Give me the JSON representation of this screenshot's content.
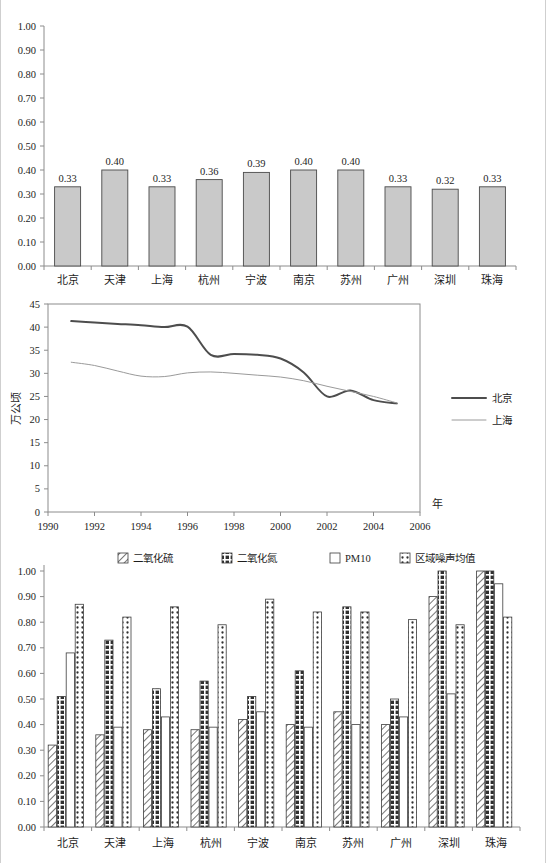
{
  "page": {
    "background": "#ffffff",
    "accent": "#c9c9c9"
  },
  "chart_data": [
    {
      "id": "chart-1",
      "type": "bar",
      "title": "",
      "xlabel": "",
      "ylabel": "",
      "ylim": [
        0.0,
        1.0
      ],
      "ytick_labels": [
        "0.00",
        "0.10",
        "0.20",
        "0.30",
        "0.40",
        "0.50",
        "0.60",
        "0.70",
        "0.80",
        "0.90",
        "1.00"
      ],
      "ytick_values": [
        0.0,
        0.1,
        0.2,
        0.3,
        0.4,
        0.5,
        0.6,
        0.7,
        0.8,
        0.9,
        1.0
      ],
      "grid": false,
      "legend": "none",
      "categories": [
        "北京",
        "天津",
        "上海",
        "杭州",
        "宁波",
        "南京",
        "苏州",
        "广州",
        "深圳",
        "珠海"
      ],
      "values": [
        0.33,
        0.4,
        0.33,
        0.36,
        0.39,
        0.4,
        0.4,
        0.33,
        0.32,
        0.33
      ],
      "data_labels": [
        "0.33",
        "0.40",
        "0.33",
        "0.36",
        "0.39",
        "0.40",
        "0.40",
        "0.33",
        "0.32",
        "0.33"
      ],
      "bar_color": "#c9c9c9",
      "bar_border": "#4a4a4a"
    },
    {
      "id": "chart-2",
      "type": "line",
      "title": "",
      "xlabel": "年",
      "ylabel": "万公顷",
      "xlim": [
        1990,
        2006
      ],
      "ylim": [
        0,
        45
      ],
      "xtick_labels": [
        "1990",
        "1992",
        "1994",
        "1996",
        "1998",
        "2000",
        "2002",
        "2004",
        "2006"
      ],
      "xtick_values": [
        1990,
        1992,
        1994,
        1996,
        1998,
        2000,
        2002,
        2004,
        2006
      ],
      "ytick_labels": [
        "0",
        "5",
        "10",
        "15",
        "20",
        "25",
        "30",
        "35",
        "40",
        "45"
      ],
      "ytick_values": [
        0,
        5,
        10,
        15,
        20,
        25,
        30,
        35,
        40,
        45
      ],
      "grid": false,
      "legend_position": "right",
      "x": [
        1991,
        1992,
        1993,
        1994,
        1995,
        1996,
        1997,
        1998,
        1999,
        2000,
        2001,
        2002,
        2003,
        2004,
        2005
      ],
      "series": [
        {
          "name": "北京",
          "color": "#4d4d4d",
          "width": 2,
          "values": [
            41.3,
            41.0,
            40.7,
            40.4,
            40.0,
            40.1,
            34.0,
            34.2,
            34.0,
            33.2,
            30.2,
            25.0,
            26.3,
            24.2,
            23.5
          ]
        },
        {
          "name": "上海",
          "color": "#9a9a9a",
          "width": 1,
          "values": [
            32.4,
            31.7,
            30.5,
            29.4,
            29.3,
            30.1,
            30.3,
            30.0,
            29.6,
            29.2,
            28.4,
            27.2,
            26.1,
            25.0,
            23.6
          ]
        }
      ]
    },
    {
      "id": "chart-3",
      "type": "bar",
      "title": "",
      "xlabel": "",
      "ylabel": "",
      "ylim": [
        0.0,
        1.0
      ],
      "ytick_labels": [
        "0.00",
        "0.10",
        "0.20",
        "0.30",
        "0.40",
        "0.50",
        "0.60",
        "0.70",
        "0.80",
        "0.90",
        "1.00"
      ],
      "ytick_values": [
        0.0,
        0.1,
        0.2,
        0.3,
        0.4,
        0.5,
        0.6,
        0.7,
        0.8,
        0.9,
        1.0
      ],
      "grid": false,
      "legend_position": "top",
      "categories": [
        "北京",
        "天津",
        "上海",
        "杭州",
        "宁波",
        "南京",
        "苏州",
        "广州",
        "深圳",
        "珠海"
      ],
      "series": [
        {
          "name": "二氧化硫",
          "pattern": "diagonal-hatch",
          "values": [
            0.32,
            0.36,
            0.38,
            0.38,
            0.42,
            0.4,
            0.45,
            0.4,
            0.9,
            1.0
          ]
        },
        {
          "name": "二氧化氮",
          "pattern": "dark-checker",
          "values": [
            0.51,
            0.73,
            0.54,
            0.57,
            0.51,
            0.61,
            0.86,
            0.5,
            1.0,
            1.0
          ]
        },
        {
          "name": "PM10",
          "pattern": "solid-white",
          "values": [
            0.68,
            0.39,
            0.43,
            0.39,
            0.45,
            0.39,
            0.4,
            0.43,
            0.52,
            0.95
          ]
        },
        {
          "name": "区域噪声均值",
          "pattern": "dotted",
          "values": [
            0.87,
            0.82,
            0.86,
            0.79,
            0.89,
            0.84,
            0.84,
            0.81,
            0.79,
            0.82
          ]
        }
      ]
    }
  ]
}
